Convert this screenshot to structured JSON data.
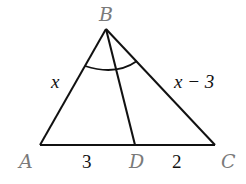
{
  "diagram": {
    "type": "triangle-angle-bisector",
    "points": {
      "A": {
        "label": "A",
        "x": 40,
        "y": 145
      },
      "B": {
        "label": "B",
        "x": 106,
        "y": 29
      },
      "C": {
        "label": "C",
        "x": 215,
        "y": 145
      },
      "D": {
        "label": "D",
        "x": 135,
        "y": 145
      }
    },
    "sides": {
      "AB": "x",
      "BC": "x − 3",
      "AD": "3",
      "DC": "2"
    },
    "segment": "BD",
    "angle_marker": "arc at B across BA, BD, BC",
    "colors": {
      "line": "#111111",
      "point_label": "#7a7a7a",
      "length_label": "#111111",
      "background": "#ffffff"
    }
  }
}
